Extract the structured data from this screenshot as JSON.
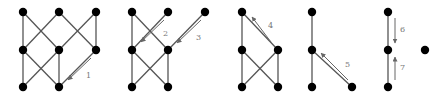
{
  "diagram": {
    "graphs": [
      {
        "id": "g1",
        "nodes": [
          [
            23,
            12
          ],
          [
            59,
            12
          ],
          [
            96,
            12
          ],
          [
            23,
            50
          ],
          [
            59,
            50
          ],
          [
            96,
            50
          ],
          [
            23,
            87
          ],
          [
            59,
            87
          ]
        ],
        "edges": [
          [
            0,
            3
          ],
          [
            0,
            4
          ],
          [
            1,
            3
          ],
          [
            1,
            5
          ],
          [
            2,
            4
          ],
          [
            2,
            5
          ],
          [
            3,
            6
          ],
          [
            3,
            7
          ],
          [
            4,
            6
          ],
          [
            4,
            7
          ],
          [
            5,
            7
          ]
        ],
        "arrows": [
          {
            "label": "1",
            "from": [
              91,
              58
            ],
            "to": [
              68,
              80
            ],
            "label_pos": [
              86,
              78
            ]
          }
        ]
      },
      {
        "id": "g2",
        "nodes": [
          [
            132,
            12
          ],
          [
            168,
            12
          ],
          [
            205,
            12
          ],
          [
            132,
            50
          ],
          [
            168,
            50
          ],
          [
            132,
            87
          ],
          [
            168,
            87
          ]
        ],
        "edges": [
          [
            0,
            3
          ],
          [
            0,
            4
          ],
          [
            1,
            3
          ],
          [
            2,
            4
          ],
          [
            3,
            5
          ],
          [
            3,
            6
          ],
          [
            4,
            5
          ],
          [
            4,
            6
          ]
        ],
        "arrows": [
          {
            "label": "2",
            "from": [
              164,
              20
            ],
            "to": [
              141,
              42
            ],
            "label_pos": [
              163,
              36
            ]
          },
          {
            "label": "3",
            "from": [
              201,
              20
            ],
            "to": [
              177,
              43
            ],
            "label_pos": [
              196,
              40
            ]
          }
        ]
      },
      {
        "id": "g3",
        "nodes": [
          [
            242,
            12
          ],
          [
            278,
            50
          ],
          [
            242,
            50
          ],
          [
            242,
            87
          ],
          [
            278,
            87
          ]
        ],
        "edges": [
          [
            0,
            1
          ],
          [
            0,
            2
          ],
          [
            2,
            3
          ],
          [
            2,
            4
          ],
          [
            1,
            3
          ],
          [
            1,
            4
          ]
        ],
        "arrows": [
          {
            "label": "4",
            "from": [
              271,
              42
            ],
            "to": [
              252,
              17
            ],
            "label_pos": [
              268,
              28
            ]
          }
        ]
      },
      {
        "id": "g4",
        "nodes": [
          [
            312,
            12
          ],
          [
            312,
            50
          ],
          [
            312,
            87
          ],
          [
            352,
            87
          ]
        ],
        "edges": [
          [
            0,
            1
          ],
          [
            1,
            2
          ],
          [
            1,
            3
          ]
        ],
        "arrows": [
          {
            "label": "5",
            "from": [
              348,
              80
            ],
            "to": [
              321,
              53
            ],
            "label_pos": [
              345,
              67
            ]
          }
        ]
      },
      {
        "id": "g5",
        "nodes": [
          [
            388,
            12
          ],
          [
            388,
            50
          ],
          [
            388,
            87
          ]
        ],
        "edges": [
          [
            0,
            1
          ],
          [
            1,
            2
          ]
        ],
        "arrows": [
          {
            "label": "6",
            "from": [
              395,
              18
            ],
            "to": [
              395,
              43
            ],
            "label_pos": [
              400,
              32
            ]
          },
          {
            "label": "7",
            "from": [
              395,
              80
            ],
            "to": [
              395,
              57
            ],
            "label_pos": [
              400,
              70
            ]
          }
        ]
      },
      {
        "id": "g6",
        "nodes": [
          [
            425,
            50
          ]
        ],
        "edges": [],
        "arrows": []
      }
    ],
    "arrow_labels": [
      "1",
      "2",
      "3",
      "4",
      "5",
      "6",
      "7"
    ]
  }
}
